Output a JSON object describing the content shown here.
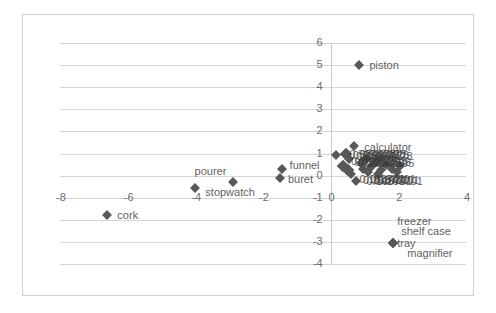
{
  "chart_data": {
    "type": "scatter",
    "title": "",
    "xlabel": "",
    "ylabel": "",
    "xlim": [
      -8,
      4
    ],
    "ylim": [
      -4,
      6
    ],
    "xticks": [
      "-8",
      "-6",
      "-4",
      "-2",
      "0",
      "2",
      "4"
    ],
    "yticks": [
      "6",
      "5",
      "4",
      "3",
      "2",
      "1",
      "0",
      "-1",
      "-2",
      "-3",
      "-4"
    ],
    "grid": true,
    "legend": "none",
    "marker_color": "#58585a",
    "grid_color": "#d6d6d6",
    "points": [
      {
        "label": "piston",
        "x": 0.85,
        "y": 5.0,
        "size": "normal"
      },
      {
        "label": "cork",
        "x": -6.6,
        "y": -1.8,
        "size": "normal"
      },
      {
        "label": "stopwatch",
        "x": -4.0,
        "y": -0.55,
        "size": "normal"
      },
      {
        "label": "pourer",
        "x": -2.9,
        "y": -0.3,
        "size": "normal"
      },
      {
        "label": "funnel",
        "x": -1.45,
        "y": 0.3,
        "size": "normal"
      },
      {
        "label": "buret",
        "x": -1.5,
        "y": -0.1,
        "size": "normal"
      },
      {
        "label": "calculator",
        "x": 0.7,
        "y": 1.35,
        "size": "normal"
      },
      {
        "label": "tray",
        "x": 1.85,
        "y": -3.05,
        "size": "normal"
      },
      {
        "label": "shelf case",
        "x": 1.85,
        "y": -3.05,
        "size": "normal"
      },
      {
        "label": "freezer",
        "x": 1.85,
        "y": -3.05,
        "size": "normal"
      },
      {
        "label": "magnifier",
        "x": 1.85,
        "y": -3.05,
        "size": "normal"
      },
      {
        "label": "",
        "x": 0.15,
        "y": 0.95,
        "size": "normal"
      },
      {
        "label": "",
        "x": 0.45,
        "y": 1.0,
        "size": "big"
      },
      {
        "label": "",
        "x": 0.55,
        "y": 0.75,
        "size": "normal"
      },
      {
        "label": "",
        "x": 0.35,
        "y": 0.45,
        "size": "big"
      },
      {
        "label": "",
        "x": 0.5,
        "y": 0.25,
        "size": "big"
      },
      {
        "label": "",
        "x": 0.6,
        "y": 0.05,
        "size": "normal"
      },
      {
        "label": "",
        "x": 0.75,
        "y": -0.25,
        "size": "normal"
      },
      {
        "label": "",
        "x": 0.9,
        "y": 0.55,
        "size": "normal"
      },
      {
        "label": "",
        "x": 1.05,
        "y": 0.75,
        "size": "normal"
      },
      {
        "label": "",
        "x": 1.2,
        "y": 0.4,
        "size": "normal"
      },
      {
        "label": "",
        "x": 1.35,
        "y": 0.6,
        "size": "normal"
      },
      {
        "label": "",
        "x": 1.5,
        "y": 0.25,
        "size": "normal"
      },
      {
        "label": "",
        "x": 1.65,
        "y": 0.5,
        "size": "normal"
      },
      {
        "label": "",
        "x": 1.8,
        "y": 0.3,
        "size": "normal"
      },
      {
        "label": "",
        "x": 1.95,
        "y": 0.15,
        "size": "normal"
      },
      {
        "label": "",
        "x": 2.05,
        "y": 0.45,
        "size": "normal"
      },
      {
        "label": "",
        "x": 1.1,
        "y": 0.15,
        "size": "normal"
      },
      {
        "label": "",
        "x": 1.4,
        "y": 0.05,
        "size": "normal"
      },
      {
        "label": "",
        "x": 0.95,
        "y": 0.3,
        "size": "normal"
      }
    ],
    "cluster_overlap_labels": [
      "calculator",
      "0.584478",
      "0.299595",
      "0.163701"
    ]
  }
}
